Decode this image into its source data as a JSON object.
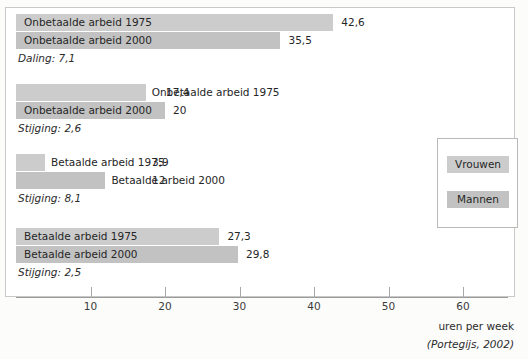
{
  "chart_data": {
    "type": "bar",
    "orientation": "horizontal",
    "title": "",
    "xlabel": "uren per week",
    "ylabel": "",
    "xlim": [
      0,
      66
    ],
    "xticks": [
      10,
      20,
      30,
      40,
      50,
      60
    ],
    "xtick_labels": [
      "10",
      "20",
      "30",
      "40",
      "50",
      "60"
    ],
    "grid": false,
    "legend_position": "right",
    "source": "(Portegijs, 2002)",
    "legend": [
      {
        "label": "Vrouwen",
        "color": "#cccccc"
      },
      {
        "label": "Mannen",
        "color": "#c2c2c2"
      }
    ],
    "groups": [
      {
        "series": "Vrouwen",
        "bars": [
          {
            "label": "Onbetaalde arbeid 1975",
            "value": 42.6,
            "value_label": "42,6",
            "year": "1975"
          },
          {
            "label": "Onbetaalde arbeid 2000",
            "value": 35.5,
            "value_label": "35,5",
            "year": "2000"
          }
        ],
        "delta": "Daling: 7,1",
        "delta_type": "daling",
        "delta_value": 7.1
      },
      {
        "series": "Mannen",
        "bars": [
          {
            "label": "Onbetaalde arbeid 1975",
            "value": 17.4,
            "value_label": "17,4",
            "year": "1975"
          },
          {
            "label": "Onbetaalde arbeid 2000",
            "value": 20,
            "value_label": "20",
            "year": "2000"
          }
        ],
        "delta": "Stijging: 2,6",
        "delta_type": "stijging",
        "delta_value": 2.6
      },
      {
        "series": "Vrouwen",
        "bars": [
          {
            "label": "Betaalde arbeid 1975",
            "value": 3.9,
            "value_label": "3,9",
            "year": "1975"
          },
          {
            "label": "Betaalde arbeid 2000",
            "value": 12,
            "value_label": "12",
            "year": "2000"
          }
        ],
        "delta": "Stijging: 8,1",
        "delta_type": "stijging",
        "delta_value": 8.1
      },
      {
        "series": "Mannen",
        "bars": [
          {
            "label": "Betaalde arbeid 1975",
            "value": 27.3,
            "value_label": "27,3",
            "year": "1975"
          },
          {
            "label": "Betaalde arbeid 2000",
            "value": 29.8,
            "value_label": "29,8",
            "year": "2000"
          }
        ],
        "delta": "Stijging: 2,5",
        "delta_type": "stijging",
        "delta_value": 2.5
      }
    ]
  },
  "layout": {
    "axis_origin_px": 16,
    "px_per_unit": 7.45,
    "group_tops": [
      14,
      84,
      154,
      228
    ],
    "bar_height": 17,
    "bar_gap": 1
  }
}
